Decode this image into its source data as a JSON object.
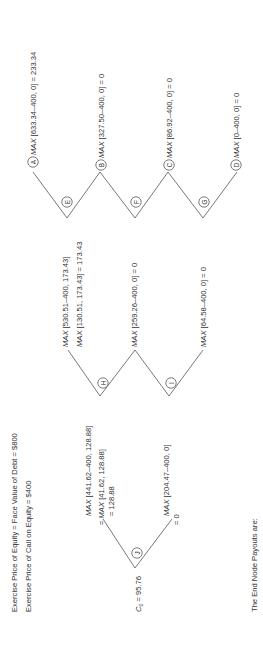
{
  "header": {
    "line1": "Exercise Price of Equity = Face Value of Debt = $800",
    "line2": "Exercise Price of Call on Equity = $400"
  },
  "root": {
    "node": "J",
    "value_prefix": "C",
    "value_sub": "0",
    "value_text": " = 95.76"
  },
  "level1": {
    "up": {
      "node": "H",
      "eq1": "= ",
      "max1": "MAX",
      "line1": " [441.62–400, 128.88]",
      "eq2": "= ",
      "max2": "MAX",
      "line2": " [41.62, 128.88]",
      "line3": "= 128.88"
    },
    "down": {
      "node": "I",
      "max1": "MAX",
      "line1": " [204.47–400, 0]",
      "line2": "= 0"
    }
  },
  "level2": {
    "up": {
      "node": "E",
      "max1": "MAX",
      "line1": " [530.51–400, 173.43]",
      "max2": "MAX",
      "line2": " [130.51, 173.43] = 173.43"
    },
    "mid": {
      "node": "F",
      "max1": "MAX",
      "line1": " [259.26–400, 0] = 0"
    },
    "down": {
      "node": "G",
      "max1": "MAX",
      "line1": " [64.58–400, 0] = 0"
    }
  },
  "end_nodes": [
    {
      "node": "A",
      "max": "MAX",
      "text": " [633.34–400, 0] = 233.34"
    },
    {
      "node": "B",
      "max": "MAX",
      "text": " [327.50–400, 0] = 0"
    },
    {
      "node": "C",
      "max": "MAX",
      "text": " [86.92–400, 0] = 0"
    },
    {
      "node": "D",
      "max": "MAX",
      "text": " [0–400, 0] = 0"
    }
  ],
  "footer": {
    "text": "The End Node Payouts are:"
  }
}
